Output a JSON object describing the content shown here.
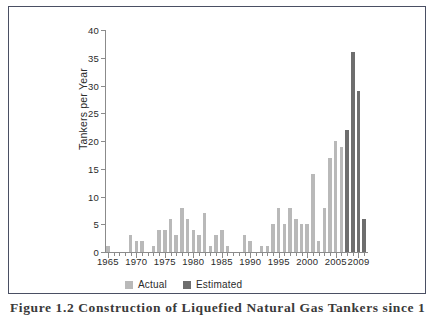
{
  "figure": {
    "caption": "Figure 1.2   Construction of Liquefied Natural Gas Tankers since 1",
    "frame_color": "#4a4f63"
  },
  "chart_data": {
    "type": "bar",
    "title": "",
    "xlabel": "",
    "ylabel": "Tankers per Year",
    "ylim": [
      0,
      40
    ],
    "xlim": [
      1965,
      2009
    ],
    "yticks": [
      "0",
      "5",
      "10",
      "15",
      "20",
      "25",
      "30",
      "35",
      "40"
    ],
    "ytick_values": [
      0,
      5,
      10,
      15,
      20,
      25,
      30,
      35,
      40
    ],
    "xticks": [
      "1965",
      "1970",
      "1975",
      "1980",
      "1985",
      "1990",
      "1995",
      "2000",
      "2005",
      "2009"
    ],
    "xtick_values": [
      1965,
      1970,
      1975,
      1980,
      1985,
      1990,
      1995,
      2000,
      2005,
      2009
    ],
    "grid": false,
    "legend_position": "bottom",
    "colors": {
      "actual": "#b9b9b9",
      "estimated": "#6e6e6e",
      "axis": "#8b8b8b",
      "text": "#2b2b2b"
    },
    "legend": [
      {
        "name": "Actual",
        "color": "#b9b9b9"
      },
      {
        "name": "Estimated",
        "color": "#6e6e6e"
      }
    ],
    "categories": [
      1965,
      1966,
      1967,
      1968,
      1969,
      1970,
      1971,
      1972,
      1973,
      1974,
      1975,
      1976,
      1977,
      1978,
      1979,
      1980,
      1981,
      1982,
      1983,
      1984,
      1985,
      1986,
      1987,
      1988,
      1989,
      1990,
      1991,
      1992,
      1993,
      1994,
      1995,
      1996,
      1997,
      1998,
      1999,
      2000,
      2001,
      2002,
      2003,
      2004,
      2005,
      2006,
      2007,
      2008,
      2009
    ],
    "series": [
      {
        "name": "Actual",
        "color": "#b9b9b9",
        "values": [
          1,
          0,
          0,
          0,
          3,
          2,
          2,
          0,
          1,
          4,
          4,
          6,
          3,
          8,
          6,
          4,
          3,
          7,
          1,
          3,
          4,
          1,
          0,
          0,
          3,
          2,
          0,
          1,
          1,
          5,
          8,
          5,
          8,
          6,
          5,
          5,
          14,
          2,
          8,
          17,
          20,
          19,
          0,
          0,
          0
        ]
      },
      {
        "name": "Estimated",
        "color": "#6e6e6e",
        "values": [
          0,
          0,
          0,
          0,
          0,
          0,
          0,
          0,
          0,
          0,
          0,
          0,
          0,
          0,
          0,
          0,
          0,
          0,
          0,
          0,
          0,
          0,
          0,
          0,
          0,
          0,
          0,
          0,
          0,
          0,
          0,
          0,
          0,
          0,
          0,
          0,
          0,
          0,
          0,
          0,
          0,
          0,
          22,
          36,
          29
        ]
      }
    ],
    "extra_bars": [
      {
        "year": 2010,
        "value": 6,
        "series": "Estimated",
        "color": "#6e6e6e"
      }
    ]
  }
}
